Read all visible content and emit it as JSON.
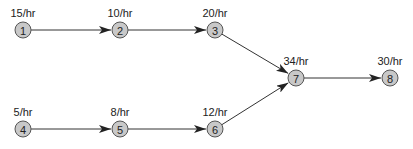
{
  "nodes": [
    {
      "id": "1",
      "rate": "15/hr",
      "x": 23,
      "y": 30
    },
    {
      "id": "2",
      "rate": "10/hr",
      "x": 120,
      "y": 30
    },
    {
      "id": "3",
      "rate": "20/hr",
      "x": 215,
      "y": 30
    },
    {
      "id": "4",
      "rate": "5/hr",
      "x": 23,
      "y": 129
    },
    {
      "id": "5",
      "rate": "8/hr",
      "x": 120,
      "y": 129
    },
    {
      "id": "6",
      "rate": "12/hr",
      "x": 215,
      "y": 129
    },
    {
      "id": "7",
      "rate": "34/hr",
      "x": 296,
      "y": 78
    },
    {
      "id": "8",
      "rate": "30/hr",
      "x": 390,
      "y": 78
    }
  ],
  "edges": [
    {
      "from": "1",
      "to": "2"
    },
    {
      "from": "2",
      "to": "3"
    },
    {
      "from": "3",
      "to": "7"
    },
    {
      "from": "4",
      "to": "5"
    },
    {
      "from": "5",
      "to": "6"
    },
    {
      "from": "6",
      "to": "7"
    },
    {
      "from": "7",
      "to": "8"
    }
  ],
  "colors": {
    "node_fill": "#c8c8c8",
    "node_stroke": "#555555",
    "edge": "#333333"
  }
}
